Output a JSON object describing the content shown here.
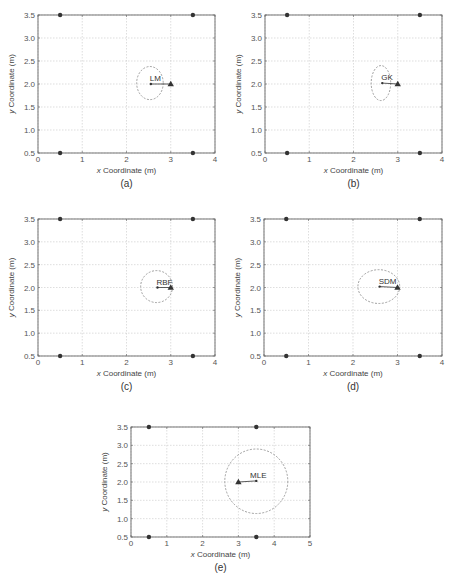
{
  "chart_data": [
    {
      "type": "scatter",
      "panel": "(a)",
      "method": "LM",
      "xlabel": "x Coordinate (m)",
      "ylabel": "y Coordinate (m)",
      "xlim": [
        0,
        4
      ],
      "ylim": [
        0.5,
        3.5
      ],
      "xticks": [
        "0",
        "1",
        "2",
        "3",
        "4"
      ],
      "yticks": [
        "0.5",
        "1.0",
        "1.5",
        "2.0",
        "2.5",
        "3.0",
        "3.5"
      ],
      "grid": true,
      "anchors": [
        [
          0.5,
          3.5
        ],
        [
          3.5,
          3.5
        ],
        [
          0.5,
          0.5
        ],
        [
          3.5,
          0.5
        ]
      ],
      "true_position": [
        3.0,
        2.0
      ],
      "estimate": [
        2.55,
        2.0
      ],
      "ellipse": {
        "cx": 2.53,
        "cy": 2.02,
        "rx": 0.3,
        "ry": 0.36
      },
      "box": {
        "left": 38,
        "top": 15,
        "right": 215,
        "bottom": 153
      },
      "caption": "(a)"
    },
    {
      "type": "scatter",
      "panel": "(b)",
      "method": "GK",
      "xlabel": "x Coordinate (m)",
      "ylabel": "y Coordinate (m)",
      "xlim": [
        0,
        4
      ],
      "ylim": [
        0.5,
        3.5
      ],
      "xticks": [
        "0",
        "1",
        "2",
        "3",
        "4"
      ],
      "yticks": [
        "0.5",
        "1.0",
        "1.5",
        "2.0",
        "2.5",
        "3.0",
        "3.5"
      ],
      "grid": true,
      "anchors": [
        [
          0.5,
          3.5
        ],
        [
          3.5,
          3.5
        ],
        [
          0.5,
          0.5
        ],
        [
          3.5,
          0.5
        ]
      ],
      "true_position": [
        3.0,
        2.0
      ],
      "estimate": [
        2.65,
        2.02
      ],
      "ellipse": {
        "cx": 2.62,
        "cy": 2.02,
        "rx": 0.22,
        "ry": 0.38
      },
      "box": {
        "left": 265,
        "top": 15,
        "right": 442,
        "bottom": 153
      },
      "caption": "(b)"
    },
    {
      "type": "scatter",
      "panel": "(c)",
      "method": "RBF",
      "xlabel": "x Coordinate (m)",
      "ylabel": "y Coordinate (m)",
      "xlim": [
        0,
        4
      ],
      "ylim": [
        0.5,
        3.5
      ],
      "xticks": [
        "0",
        "1",
        "2",
        "3",
        "4"
      ],
      "yticks": [
        "0.5",
        "1.0",
        "1.5",
        "2.0",
        "2.5",
        "3.0",
        "3.5"
      ],
      "grid": true,
      "anchors": [
        [
          0.5,
          3.5
        ],
        [
          3.5,
          3.5
        ],
        [
          0.5,
          0.5
        ],
        [
          3.5,
          0.5
        ]
      ],
      "true_position": [
        3.0,
        2.0
      ],
      "estimate": [
        2.7,
        2.0
      ],
      "ellipse": {
        "cx": 2.68,
        "cy": 2.02,
        "rx": 0.36,
        "ry": 0.35
      },
      "box": {
        "left": 38,
        "top": 219,
        "right": 215,
        "bottom": 356
      },
      "caption": "(c)"
    },
    {
      "type": "scatter",
      "panel": "(d)",
      "method": "SDM",
      "xlabel": "x Coordinate (m)",
      "ylabel": "y Coordinate (m)",
      "xlim": [
        0,
        4
      ],
      "ylim": [
        0.5,
        3.5
      ],
      "xticks": [
        "0",
        "1",
        "2",
        "3",
        "4"
      ],
      "yticks": [
        "0.5",
        "1.0",
        "1.5",
        "2.0",
        "2.5",
        "3.0",
        "3.5"
      ],
      "grid": true,
      "anchors": [
        [
          0.5,
          3.5
        ],
        [
          3.5,
          3.5
        ],
        [
          0.5,
          0.5
        ],
        [
          3.5,
          0.5
        ]
      ],
      "true_position": [
        3.0,
        2.0
      ],
      "estimate": [
        2.6,
        2.02
      ],
      "ellipse": {
        "cx": 2.58,
        "cy": 2.02,
        "rx": 0.47,
        "ry": 0.37
      },
      "box": {
        "left": 264,
        "top": 219,
        "right": 442,
        "bottom": 356
      },
      "caption": "(d)"
    },
    {
      "type": "scatter",
      "panel": "(e)",
      "method": "MLE",
      "xlabel": "x Coordinate (m)",
      "ylabel": "y Coordinate (m)",
      "xlim": [
        0,
        5
      ],
      "ylim": [
        0.5,
        3.5
      ],
      "xticks": [
        "0",
        "1",
        "2",
        "3",
        "4",
        "5"
      ],
      "yticks": [
        "0.5",
        "1.0",
        "1.5",
        "2.0",
        "2.5",
        "3.0",
        "3.5"
      ],
      "grid": true,
      "anchors": [
        [
          0.5,
          3.5
        ],
        [
          3.5,
          3.5
        ],
        [
          0.5,
          0.5
        ],
        [
          3.5,
          0.5
        ]
      ],
      "true_position": [
        3.0,
        2.0
      ],
      "estimate": [
        3.5,
        2.03
      ],
      "ellipse": {
        "cx": 3.5,
        "cy": 2.02,
        "rx": 0.88,
        "ry": 0.88
      },
      "box": {
        "left": 131,
        "top": 427,
        "right": 310,
        "bottom": 537
      },
      "caption": "(e)"
    }
  ],
  "colors": {
    "axis": "#666666",
    "grid": "#c8c8c8",
    "marker": "#333333",
    "ellipse": "#888888"
  }
}
